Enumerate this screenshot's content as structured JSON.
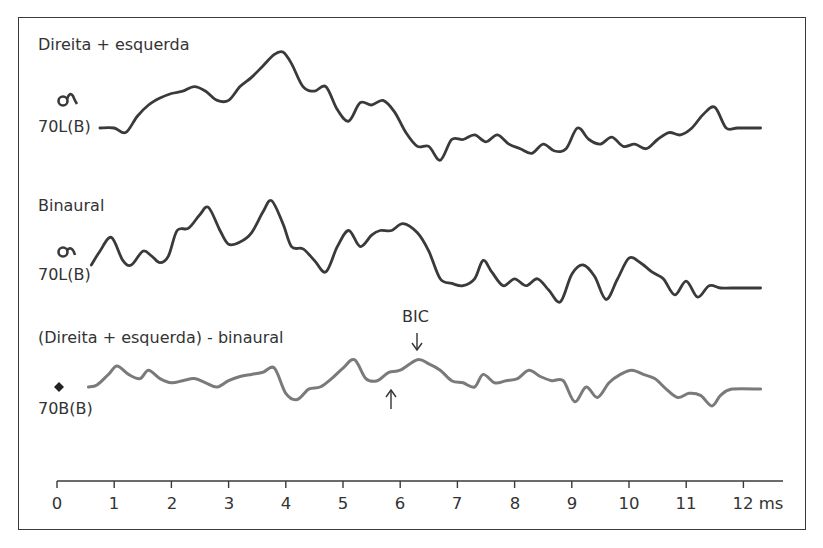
{
  "chart_data": {
    "type": "line",
    "title": "",
    "xlabel": "ms",
    "ylabel": "",
    "xlim": [
      0,
      12
    ],
    "x_ticks": [
      "0",
      "1",
      "2",
      "3",
      "4",
      "5",
      "6",
      "7",
      "8",
      "9",
      "10",
      "11",
      "12"
    ],
    "x_unit": "ms",
    "grid": false,
    "legend": "none",
    "series": [
      {
        "name": "Direita + esquerda",
        "stimulus_label": "70L(B)",
        "color": "#3a3a3a",
        "x": [
          0.75,
          1.0,
          1.2,
          1.4,
          1.6,
          1.8,
          2.0,
          2.2,
          2.4,
          2.6,
          2.8,
          3.0,
          3.2,
          3.4,
          3.6,
          3.8,
          3.95,
          4.1,
          4.3,
          4.5,
          4.7,
          4.9,
          5.1,
          5.3,
          5.5,
          5.7,
          5.9,
          6.1,
          6.3,
          6.5,
          6.7,
          6.9,
          7.1,
          7.3,
          7.5,
          7.7,
          7.9,
          8.1,
          8.3,
          8.5,
          8.7,
          8.9,
          9.1,
          9.3,
          9.5,
          9.7,
          9.9,
          10.1,
          10.3,
          10.5,
          10.7,
          10.9,
          11.1,
          11.3,
          11.5,
          11.7,
          11.9,
          12.3
        ],
        "y": [
          0.0,
          0.0,
          -0.2,
          0.5,
          1.0,
          1.3,
          1.5,
          1.6,
          1.8,
          1.6,
          1.2,
          1.2,
          1.8,
          2.2,
          2.7,
          3.2,
          3.3,
          2.8,
          1.8,
          1.6,
          1.8,
          0.8,
          0.3,
          1.1,
          1.0,
          1.2,
          0.7,
          -0.2,
          -0.8,
          -0.8,
          -1.4,
          -0.5,
          -0.5,
          -0.3,
          -0.6,
          -0.3,
          -0.7,
          -0.9,
          -1.1,
          -0.7,
          -1.0,
          -0.9,
          0.0,
          -0.5,
          -0.7,
          -0.4,
          -0.8,
          -0.7,
          -0.9,
          -0.5,
          -0.2,
          -0.3,
          0.0,
          0.6,
          0.9,
          0.0,
          0.0,
          0.0
        ]
      },
      {
        "name": "Binaural",
        "stimulus_label": "70L(B)",
        "color": "#3a3a3a",
        "x": [
          0.6,
          0.75,
          0.95,
          1.15,
          1.3,
          1.5,
          1.65,
          1.8,
          1.95,
          2.1,
          2.3,
          2.5,
          2.65,
          2.85,
          3.0,
          3.2,
          3.4,
          3.6,
          3.75,
          3.95,
          4.1,
          4.3,
          4.5,
          4.7,
          4.9,
          5.1,
          5.3,
          5.5,
          5.65,
          5.85,
          6.05,
          6.3,
          6.5,
          6.7,
          6.9,
          7.1,
          7.3,
          7.45,
          7.6,
          7.8,
          8.0,
          8.2,
          8.4,
          8.6,
          8.8,
          9.0,
          9.2,
          9.4,
          9.6,
          9.8,
          10.0,
          10.2,
          10.4,
          10.6,
          10.8,
          11.0,
          11.2,
          11.4,
          11.6,
          11.8,
          12.3
        ],
        "y": [
          0.0,
          0.6,
          1.2,
          0.2,
          0.0,
          0.6,
          0.4,
          0.1,
          0.4,
          1.5,
          1.6,
          2.2,
          2.5,
          1.5,
          0.9,
          1.0,
          1.4,
          2.3,
          2.8,
          1.8,
          0.8,
          0.7,
          0.2,
          -0.3,
          0.8,
          1.5,
          0.8,
          1.3,
          1.5,
          1.5,
          1.8,
          1.4,
          0.6,
          -0.6,
          -0.8,
          -0.9,
          -0.6,
          0.2,
          -0.3,
          -0.9,
          -0.6,
          -0.9,
          -0.6,
          -1.1,
          -1.6,
          -0.4,
          0.0,
          -0.5,
          -1.5,
          -0.6,
          0.3,
          0.1,
          -0.3,
          -0.6,
          -1.3,
          -0.7,
          -1.4,
          -0.9,
          -1.0,
          -1.0,
          -1.0
        ]
      },
      {
        "name": "(Direita + esquerda) - binaural",
        "stimulus_label": "70B(B)",
        "color": "#7a7a7a",
        "x": [
          0.55,
          0.7,
          0.9,
          1.05,
          1.25,
          1.45,
          1.6,
          1.8,
          2.0,
          2.2,
          2.4,
          2.6,
          2.8,
          3.0,
          3.2,
          3.4,
          3.6,
          3.8,
          4.0,
          4.2,
          4.4,
          4.6,
          4.8,
          5.0,
          5.2,
          5.4,
          5.6,
          5.8,
          6.0,
          6.3,
          6.5,
          6.7,
          6.9,
          7.1,
          7.3,
          7.45,
          7.65,
          7.85,
          8.05,
          8.25,
          8.45,
          8.65,
          8.85,
          9.05,
          9.25,
          9.45,
          9.65,
          9.85,
          10.05,
          10.25,
          10.45,
          10.65,
          10.85,
          11.05,
          11.25,
          11.45,
          11.6,
          11.8,
          12.3
        ],
        "y": [
          0.0,
          0.1,
          0.6,
          1.0,
          0.6,
          0.4,
          0.8,
          0.4,
          0.2,
          0.3,
          0.4,
          0.2,
          0.0,
          0.3,
          0.5,
          0.6,
          0.7,
          0.9,
          -0.3,
          -0.6,
          -0.1,
          0.0,
          0.4,
          0.9,
          1.3,
          0.4,
          0.3,
          0.7,
          0.8,
          1.3,
          1.1,
          0.8,
          0.3,
          0.2,
          0.0,
          0.6,
          0.2,
          0.3,
          0.4,
          0.8,
          0.5,
          0.3,
          0.3,
          -0.7,
          0.0,
          -0.5,
          0.2,
          0.6,
          0.8,
          0.6,
          0.4,
          -0.1,
          -0.5,
          -0.3,
          -0.4,
          -0.9,
          -0.4,
          -0.1,
          -0.1
        ]
      }
    ],
    "annotations": [
      {
        "text": "BIC",
        "x": 6.3,
        "arrow": "down",
        "target_series": "(Direita + esquerda) - binaural"
      },
      {
        "text": "",
        "x": 5.85,
        "arrow": "up",
        "target_series": "(Direita + esquerda) - binaural"
      }
    ]
  },
  "labels": {
    "trace1_title": "Direita + esquerda",
    "trace1_stim": "70L(B)",
    "trace2_title": "Binaural",
    "trace2_stim": "70L(B)",
    "trace3_title": "(Direita + esquerda) - binaural",
    "trace3_stim": "70B(B)",
    "bic": "BIC",
    "tick_0": "0",
    "tick_1": "1",
    "tick_2": "2",
    "tick_3": "3",
    "tick_4": "4",
    "tick_5": "5",
    "tick_6": "6",
    "tick_7": "7",
    "tick_8": "8",
    "tick_9": "9",
    "tick_10": "10",
    "tick_11": "11",
    "tick_12": "12 ms"
  },
  "colors": {
    "trace_dark": "#3a3a3a",
    "trace_gray": "#7a7a7a",
    "text": "#333333",
    "frame": "#3a3a3a"
  }
}
